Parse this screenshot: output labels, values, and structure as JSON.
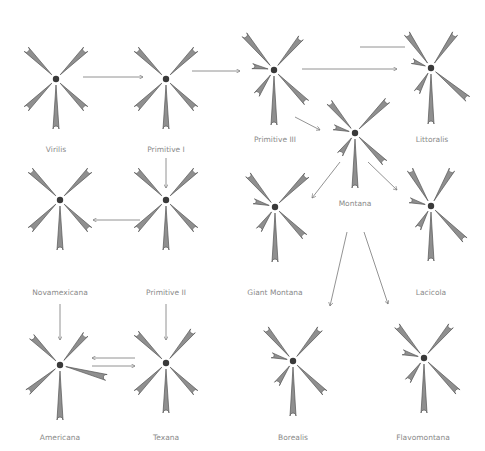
{
  "diagram": {
    "colors": {
      "arm": "#8f8f8f",
      "outline": "#555555",
      "centromere": "#3a3a3a",
      "text": "#8a8a8a",
      "arrow": "#777777"
    },
    "species": [
      {
        "id": "virilis",
        "label": "Virilis",
        "x": 42,
        "y": 100
      },
      {
        "id": "primitive1",
        "label": "Primitive I",
        "x": 166,
        "y": 100
      },
      {
        "id": "primitive3",
        "label": "Primitive III",
        "x": 272,
        "y": 90
      },
      {
        "id": "littoralis",
        "label": "Littoralis",
        "x": 432,
        "y": 88
      },
      {
        "id": "montana",
        "label": "Montana",
        "x": 355,
        "y": 150
      },
      {
        "id": "novamexicana",
        "label": "Novamexicana",
        "x": 60,
        "y": 220
      },
      {
        "id": "primitive2",
        "label": "Primitive II",
        "x": 166,
        "y": 220
      },
      {
        "id": "giantmontana",
        "label": "Giant Montana",
        "x": 275,
        "y": 215
      },
      {
        "id": "lacicola",
        "label": "Lacicola",
        "x": 431,
        "y": 216
      },
      {
        "id": "americana",
        "label": "Americana",
        "x": 60,
        "y": 363
      },
      {
        "id": "texana",
        "label": "Texana",
        "x": 166,
        "y": 363
      },
      {
        "id": "borealis",
        "label": "Borealis",
        "x": 293,
        "y": 361
      },
      {
        "id": "flavomontana",
        "label": "Flavomontana",
        "x": 424,
        "y": 358
      }
    ],
    "arm_numbers": [
      "2",
      "3",
      "4",
      "5",
      "6",
      "X"
    ]
  }
}
